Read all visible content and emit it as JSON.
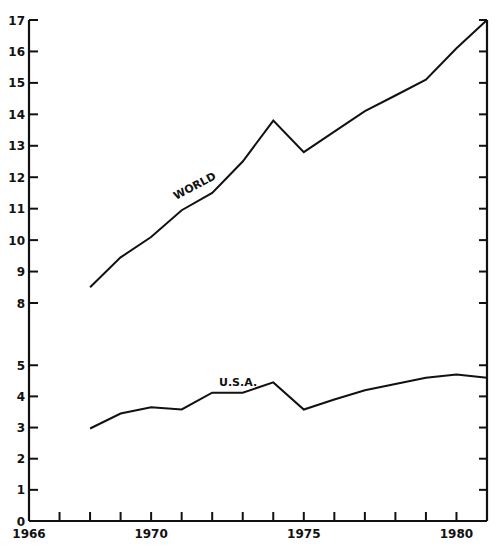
{
  "chart_data": {
    "type": "line",
    "title": "",
    "xlabel": "",
    "ylabel": "",
    "x": [
      1968,
      1969,
      1970,
      1971,
      1972,
      1973,
      1974,
      1975,
      1976,
      1977,
      1978,
      1979,
      1980,
      1981
    ],
    "series": [
      {
        "name": "WORLD",
        "values": [
          8.5,
          9.45,
          10.1,
          10.95,
          11.5,
          12.5,
          13.8,
          12.8,
          13.45,
          14.1,
          14.6,
          15.1,
          16.1,
          17.0
        ]
      },
      {
        "name": "U.S.A.",
        "values": [
          2.97,
          3.45,
          3.65,
          3.58,
          4.12,
          4.12,
          4.45,
          3.58,
          3.9,
          4.2,
          4.4,
          4.6,
          4.7,
          4.6
        ]
      }
    ],
    "xlim": [
      1966,
      1981
    ],
    "ylim": [
      0,
      17
    ],
    "y_axis_break": [
      5,
      8
    ],
    "x_tick_labels": [
      "1966",
      "1970",
      "1975",
      "1980"
    ],
    "x_tick_label_values": [
      1966,
      1970,
      1975,
      1980
    ],
    "x_minor_ticks": [
      1967,
      1968,
      1969,
      1970,
      1971,
      1972,
      1973,
      1974,
      1975,
      1976,
      1977,
      1978,
      1979,
      1980
    ],
    "y_tick_labels": [
      "0",
      "1",
      "2",
      "3",
      "4",
      "5",
      "8",
      "9",
      "10",
      "11",
      "12",
      "13",
      "14",
      "15",
      "16",
      "17"
    ],
    "y_tick_values": [
      0,
      1,
      2,
      3,
      4,
      5,
      8,
      9,
      10,
      11,
      12,
      13,
      14,
      15,
      16,
      17
    ],
    "grid": false,
    "legend": "inline-labels"
  }
}
